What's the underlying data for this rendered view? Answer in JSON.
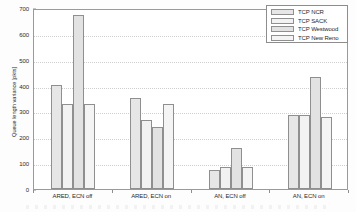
{
  "chart_data": {
    "type": "bar",
    "title": "",
    "xlabel": "",
    "ylabel": "Queue length variance [pkts]",
    "ylim": [
      0,
      700
    ],
    "yticks": [
      0,
      100,
      200,
      300,
      400,
      500,
      600,
      700
    ],
    "ytick_labels": [
      "0",
      "100",
      "200",
      "300",
      "400",
      "500",
      "600",
      "700"
    ],
    "grid": true,
    "legend_position": "top-right",
    "categories": [
      "ARED, ECN off",
      "ARED, ECN on",
      "AN, ECN off",
      "AN, ECN on"
    ],
    "series": [
      {
        "name": "TCP NCR",
        "values": [
          403,
          352,
          75,
          285
        ]
      },
      {
        "name": "TCP SACK",
        "values": [
          330,
          267,
          84,
          285
        ]
      },
      {
        "name": "TCP Westwood",
        "values": [
          672,
          240,
          157,
          433
        ]
      },
      {
        "name": "TCP New Reno",
        "values": [
          330,
          328,
          86,
          280
        ]
      }
    ]
  },
  "colors": {
    "bar_fill": "#ebebeb",
    "bar_border": "#8f8f8f",
    "axis": "#8d8d8d",
    "grid": "#cfcfcf",
    "text": "#2a2a2a"
  }
}
